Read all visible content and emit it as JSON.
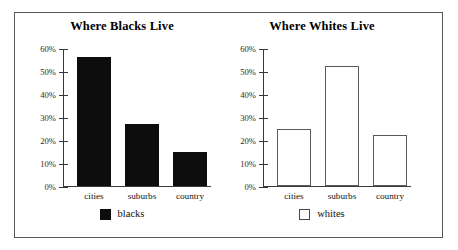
{
  "figure": {
    "background_color": "#ffffff",
    "frame_color": "#56565a"
  },
  "chart_data": [
    {
      "type": "bar",
      "title": "Where Blacks Live",
      "categories": [
        "cities",
        "suburbs",
        "country"
      ],
      "values": [
        56,
        27,
        15
      ],
      "xlabel": "",
      "ylabel": "",
      "ylim": [
        0,
        60
      ],
      "ytick_labels": [
        "60%",
        "50%",
        "40%",
        "30%",
        "20%",
        "10%",
        "0%"
      ],
      "ytick_values": [
        60,
        50,
        40,
        30,
        20,
        10,
        0
      ],
      "grid": false,
      "legend": [
        {
          "label": "blacks",
          "swatch": "filled",
          "color": "#0d0d0d"
        }
      ],
      "legend_position": "bottom-center",
      "bar_style": "filled",
      "bar_color": "#0d0d0d"
    },
    {
      "type": "bar",
      "title": "Where Whites Live",
      "categories": [
        "cities",
        "suburbs",
        "country"
      ],
      "values": [
        25,
        52,
        22
      ],
      "xlabel": "",
      "ylabel": "",
      "ylim": [
        0,
        60
      ],
      "ytick_labels": [
        "60%",
        "50%",
        "40%",
        "30%",
        "20%",
        "10%",
        "0%"
      ],
      "ytick_values": [
        60,
        50,
        40,
        30,
        20,
        10,
        0
      ],
      "grid": false,
      "legend": [
        {
          "label": "whites",
          "swatch": "hollow",
          "color": "#ffffff"
        }
      ],
      "legend_position": "bottom-center",
      "bar_style": "hollow",
      "bar_color": "#ffffff",
      "bar_edge_color": "#5a5a5e"
    }
  ]
}
